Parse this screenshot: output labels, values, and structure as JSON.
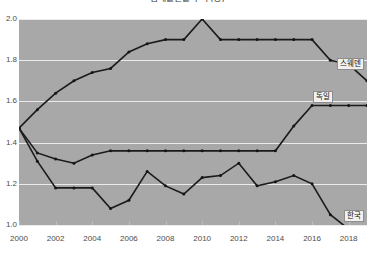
{
  "chart_data": {
    "type": "line",
    "title": "합계출산율 추이 (명)",
    "xlabel": "",
    "ylabel": "",
    "x": [
      2000,
      2001,
      2002,
      2003,
      2004,
      2005,
      2006,
      2007,
      2008,
      2009,
      2010,
      2011,
      2012,
      2013,
      2014,
      2015,
      2016,
      2017,
      2018,
      2019
    ],
    "xlim": [
      2000,
      2019
    ],
    "ylim": [
      1.0,
      2.0
    ],
    "yticks": [
      1.0,
      1.2,
      1.4,
      1.6,
      1.8,
      2.0
    ],
    "ytick_labels": [
      "1.0",
      "1.2",
      "1.4",
      "1.6",
      "1.8",
      "2.0"
    ],
    "xticks": [
      2000,
      2002,
      2004,
      2006,
      2008,
      2010,
      2012,
      2014,
      2016,
      2018
    ],
    "xtick_labels": [
      "2000",
      "2002",
      "2004",
      "2006",
      "2008",
      "2010",
      "2012",
      "2014",
      "2016",
      "2018"
    ],
    "grid": true,
    "legend": "inline-labels",
    "markers": true,
    "series": [
      {
        "name": "스웨덴",
        "color": "#1b1b1b",
        "values": [
          1.47,
          1.56,
          1.64,
          1.7,
          1.74,
          1.76,
          1.84,
          1.88,
          1.9,
          1.9,
          2.0,
          1.9,
          1.9,
          1.9,
          1.9,
          1.9,
          1.9,
          1.8,
          1.78,
          1.7
        ]
      },
      {
        "name": "독일",
        "color": "#1b1b1b",
        "values": [
          1.47,
          1.35,
          1.32,
          1.3,
          1.34,
          1.36,
          1.36,
          1.36,
          1.36,
          1.36,
          1.36,
          1.36,
          1.36,
          1.36,
          1.36,
          1.48,
          1.58,
          1.58,
          1.58,
          1.58
        ]
      },
      {
        "name": "한국",
        "color": "#1b1b1b",
        "values": [
          1.47,
          1.31,
          1.18,
          1.18,
          1.18,
          1.08,
          1.12,
          1.26,
          1.19,
          1.15,
          1.23,
          1.24,
          1.3,
          1.19,
          1.21,
          1.24,
          1.2,
          1.05,
          0.98,
          0.92
        ]
      }
    ]
  },
  "labels": {
    "sweden": "스웨덴",
    "germany": "독일",
    "korea": "한국"
  },
  "colors": {
    "plot_background": "#a8a8a8",
    "gridline": "#eceaea",
    "line": "#1b1b1b",
    "tick_text": "#4b4b4b",
    "label_box_background": "#f2f1ef",
    "label_box_border": "#8d8d8d"
  }
}
